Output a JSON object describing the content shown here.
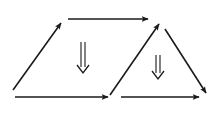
{
  "diagram": {
    "type": "commutative-diagram",
    "colors": {
      "stroke": "#1a1a1a",
      "background": "#ffffff"
    },
    "arrows": [
      {
        "id": "left-diagonal",
        "x1": 13,
        "y1": 90,
        "x2": 61,
        "y2": 23
      },
      {
        "id": "top-horizontal",
        "x1": 68,
        "y1": 19,
        "x2": 148,
        "y2": 19
      },
      {
        "id": "middle-diagonal",
        "x1": 110,
        "y1": 95,
        "x2": 159,
        "y2": 24
      },
      {
        "id": "right-diagonal",
        "x1": 165,
        "y1": 29,
        "x2": 206,
        "y2": 93
      },
      {
        "id": "bottom-left-horizontal",
        "x1": 15,
        "y1": 97,
        "x2": 108,
        "y2": 97
      },
      {
        "id": "bottom-right-horizontal",
        "x1": 121,
        "y1": 97,
        "x2": 199,
        "y2": 97
      }
    ],
    "double_arrows": [
      {
        "id": "left-2cell",
        "x": 83,
        "y1": 42,
        "y2": 73
      },
      {
        "id": "right-2cell",
        "x": 158,
        "y1": 55,
        "y2": 79
      }
    ]
  }
}
